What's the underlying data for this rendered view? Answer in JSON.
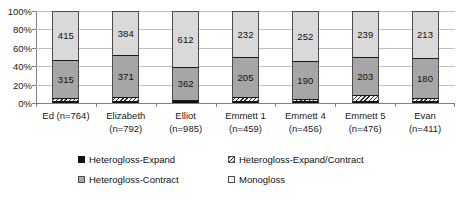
{
  "chart_data": {
    "type": "bar",
    "subtype": "stacked-100-percent",
    "title": "",
    "xlabel": "",
    "ylabel": "",
    "ylim": [
      0,
      100
    ],
    "ytick_labels": [
      "100%",
      "80%",
      "60%",
      "40%",
      "20%",
      "0%"
    ],
    "ytick_values": [
      100,
      80,
      60,
      40,
      20,
      0
    ],
    "grid": true,
    "legend_position": "bottom",
    "categories": [
      "Ed (n=764)",
      "Elizabeth (n=792)",
      "Elliot (n=985)",
      "Emmett 1 (n=459)",
      "Emmett 4 (n=456)",
      "Emmett 5 (n=476)",
      "Evan (n=411)"
    ],
    "category_lines": [
      [
        "Ed (n=764)"
      ],
      [
        "Elizabeth",
        "(n=792)"
      ],
      [
        "Elliot",
        "(n=985)"
      ],
      [
        "Emmett 1",
        "(n=459)"
      ],
      [
        "Emmett 4",
        "(n=456)"
      ],
      [
        "Emmett 5",
        "(n=476)"
      ],
      [
        "Evan",
        "(n=411)"
      ]
    ],
    "series": [
      {
        "name": "Heterogloss-Expand",
        "color": "#111111",
        "values": [
          6,
          6,
          3,
          4,
          4,
          4,
          4
        ],
        "labels": [
          "",
          "",
          "",
          "",
          "",
          "",
          ""
        ]
      },
      {
        "name": "Heterogloss-Expand/Contract",
        "color": "#2b2b2b",
        "pattern": "diagonal-hatch",
        "values": [
          28,
          31,
          8,
          18,
          10,
          30,
          14
        ],
        "labels": [
          "",
          "",
          "",
          "",
          "",
          "",
          ""
        ]
      },
      {
        "name": "Heterogloss-Contract",
        "color": "#a6a6a6",
        "values": [
          315,
          371,
          362,
          205,
          190,
          203,
          180
        ],
        "labels": [
          "315",
          "371",
          "362",
          "205",
          "190",
          "203",
          "180"
        ]
      },
      {
        "name": "Monogloss",
        "color": "#d9d9d9",
        "values": [
          415,
          384,
          612,
          232,
          252,
          239,
          213
        ],
        "labels": [
          "415",
          "384",
          "612",
          "232",
          "252",
          "239",
          "213"
        ]
      }
    ]
  },
  "legend": {
    "items": [
      {
        "label": "Heterogloss-Expand",
        "swatch": "sw-expand"
      },
      {
        "label": "Heterogloss-Expand/Contract",
        "swatch": "sw-expcon"
      },
      {
        "label": "Heterogloss-Contract",
        "swatch": "sw-contract"
      },
      {
        "label": "Monogloss",
        "swatch": "sw-mono"
      }
    ]
  },
  "colors": {
    "monogloss": "#d9d9d9",
    "heterogloss_contract": "#a6a6a6",
    "heterogloss_expand": "#111111",
    "gridline": "#bfbfbf",
    "axis": "#808080",
    "background": "#ffffff"
  }
}
